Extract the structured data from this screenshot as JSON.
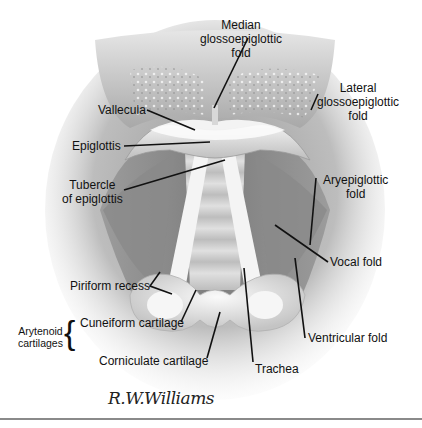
{
  "figure": {
    "labels": {
      "median_glossoepiglottic_fold": [
        "Median",
        "glossoepiglottic",
        "fold"
      ],
      "lateral_glossoepiglottic_fold": [
        "Lateral",
        "glossoepiglottic",
        "fold"
      ],
      "vallecula": "Vallecula",
      "epiglottis": "Epiglottis",
      "tubercle_of_epiglottis": [
        "Tubercle",
        "of epiglottis"
      ],
      "aryepiglottic_fold": [
        "Aryepiglottic",
        "fold"
      ],
      "vocal_fold": "Vocal fold",
      "piriform_recess": "Piriform recess",
      "cuneiform_cartilage": "Cuneiform cartilage",
      "arytenoid_cartilages": [
        "Arytenoid",
        "cartilages"
      ],
      "corniculate_cartilage": "Corniculate cartilage",
      "ventricular_fold": "Ventricular fold",
      "trachea": "Trachea"
    },
    "signature": "R.W.Williams"
  }
}
